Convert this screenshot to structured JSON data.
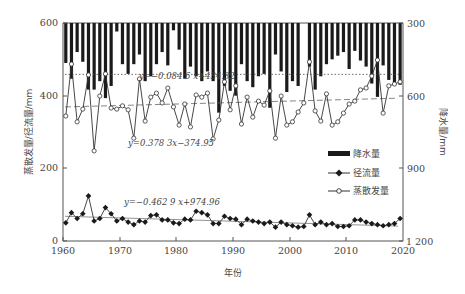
{
  "chart_data": {
    "type": "bar+line",
    "title": "",
    "xlabel": "年份",
    "ylabel_left": "蒸散发量/径流量/mm",
    "ylabel_right": "降水量/mm",
    "x_ticks": [
      "1960",
      "1970",
      "1980",
      "1990",
      "2000",
      "2010",
      "2020"
    ],
    "y_left_ticks": [
      "0",
      "200",
      "400",
      "600"
    ],
    "y_right_ticks": [
      "300",
      "600",
      "900",
      "1 200"
    ],
    "xlim": [
      1960,
      2020
    ],
    "ylim_left": [
      0,
      600
    ],
    "ylim_right_inverted": [
      300,
      1200
    ],
    "grid": false,
    "legend_position": "lower-right",
    "legend": [
      "降水量",
      "径流量",
      "蒸散发量"
    ],
    "x": [
      1960,
      1961,
      1962,
      1963,
      1964,
      1965,
      1966,
      1967,
      1968,
      1969,
      1970,
      1971,
      1972,
      1973,
      1974,
      1975,
      1976,
      1977,
      1978,
      1979,
      1980,
      1981,
      1982,
      1983,
      1984,
      1985,
      1986,
      1987,
      1988,
      1989,
      1990,
      1991,
      1992,
      1993,
      1994,
      1995,
      1996,
      1997,
      1998,
      1999,
      2000,
      2001,
      2002,
      2003,
      2004,
      2005,
      2006,
      2007,
      2008,
      2009,
      2010,
      2011,
      2012,
      2013,
      2014,
      2015,
      2016,
      2017,
      2018,
      2019
    ],
    "series": [
      {
        "name": "降水量",
        "type": "bar",
        "axis": "right-inverted",
        "values": [
          465,
          530,
          420,
          460,
          575,
          575,
          540,
          610,
          560,
          335,
          470,
          510,
          470,
          430,
          540,
          520,
          470,
          420,
          475,
          330,
          410,
          530,
          480,
          520,
          540,
          500,
          540,
          670,
          560,
          580,
          600,
          470,
          540,
          565,
          520,
          510,
          650,
          430,
          500,
          585,
          540,
          560,
          300,
          480,
          575,
          520,
          470,
          450,
          435,
          420,
          490,
          415,
          455,
          480,
          550,
          605,
          475,
          535,
          545,
          555
        ]
      },
      {
        "name": "径流量",
        "type": "line",
        "marker": "diamond-filled",
        "axis": "left",
        "values": [
          50,
          78,
          62,
          75,
          124,
          55,
          62,
          92,
          75,
          55,
          62,
          52,
          45,
          55,
          52,
          70,
          72,
          58,
          58,
          50,
          48,
          60,
          58,
          82,
          78,
          72,
          48,
          48,
          68,
          62,
          60,
          45,
          60,
          55,
          52,
          48,
          52,
          38,
          52,
          45,
          42,
          38,
          40,
          72,
          45,
          52,
          45,
          48,
          40,
          40,
          42,
          58,
          58,
          52,
          48,
          45,
          42,
          45,
          48,
          62
        ]
      },
      {
        "name": "蒸散发量",
        "type": "line",
        "marker": "circle-open",
        "axis": "left",
        "values": [
          344,
          487,
          328,
          363,
          457,
          248,
          399,
          460,
          366,
          363,
          372,
          361,
          283,
          446,
          330,
          396,
          407,
          380,
          421,
          369,
          319,
          377,
          314,
          402,
          396,
          407,
          281,
          333,
          438,
          361,
          427,
          322,
          396,
          341,
          385,
          374,
          413,
          283,
          399,
          319,
          328,
          355,
          380,
          493,
          358,
          330,
          405,
          319,
          328,
          352,
          377,
          385,
          416,
          421,
          454,
          498,
          352,
          427,
          432,
          438
        ]
      }
    ],
    "trendlines": [
      {
        "series": "降水量",
        "equation": "y=−0.084 6 x+434.32",
        "style": "dotted",
        "y_level_right": 512
      },
      {
        "series": "蒸散发量",
        "equation": "y=0.378 3x−374.95",
        "style": "dashed",
        "start": 369,
        "end": 393
      },
      {
        "series": "径流量",
        "equation": "y=−0.462 9 x+974.96",
        "style": "solid-thin",
        "start": 68,
        "end": 41
      }
    ]
  },
  "labels": {
    "eq_precip": "y=−0.084 6 x+434.32",
    "eq_evap": "y=0.378 3x−374.95",
    "eq_runoff": "y=−0.462 9 x+974.96",
    "xlabel": "年份",
    "ylabel_left": "蒸散发量/径流量/mm",
    "ylabel_right": "降水量/mm",
    "legend_precip": "降水量",
    "legend_runoff": "径流量",
    "legend_evap": "蒸散发量",
    "xt0": "1960",
    "xt1": "1970",
    "xt2": "1980",
    "xt3": "1990",
    "xt4": "2000",
    "xt5": "2010",
    "xt6": "2020",
    "yl0": "0",
    "yl1": "200",
    "yl2": "400",
    "yl3": "600",
    "yr0": "300",
    "yr1": "600",
    "yr2": "900",
    "yr3": "1 200"
  },
  "colors": {
    "bar": "#1a1a1a",
    "line": "#333333",
    "axis": "#555555"
  }
}
